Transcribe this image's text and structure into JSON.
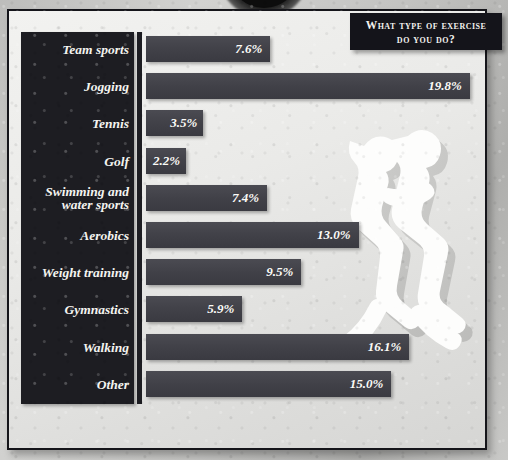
{
  "title": {
    "line1": "What type of exercise",
    "line2": "do you do?",
    "full": "What type of exercise do you do?"
  },
  "colors": {
    "panel_dark": "#1d1d22",
    "bar_fill": "#414148",
    "value_text": "#fbfbf7",
    "label_text": "#f4f4f0",
    "page_background": "#c4c4c2",
    "chart_background": "#eaeae8"
  },
  "decor": {
    "runners_watermark": "two-runners-silhouette",
    "top_arc": "dark-arc-shape"
  },
  "chart_data": {
    "type": "bar",
    "orientation": "horizontal",
    "title": "What type of exercise do you do?",
    "xlabel": "",
    "ylabel": "",
    "xlim": [
      0,
      20
    ],
    "grid": false,
    "legend": "none",
    "unit": "%",
    "categories": [
      "Team sports",
      "Jogging",
      "Tennis",
      "Golf",
      "Swimming and water sports",
      "Aerobics",
      "Weight training",
      "Gymnastics",
      "Walking",
      "Other"
    ],
    "values": [
      7.6,
      19.8,
      3.5,
      2.2,
      7.4,
      13.0,
      9.5,
      5.9,
      16.1,
      15.0
    ],
    "labels": [
      "7.6%",
      "19.8%",
      "3.5%",
      "2.2%",
      "7.4%",
      "13.0%",
      "9.5%",
      "5.9%",
      "16.1%",
      "15.0%"
    ]
  },
  "rows": [
    {
      "label": "Team sports",
      "label2": "",
      "value": "7.6%",
      "pct": 7.6
    },
    {
      "label": "Jogging",
      "label2": "",
      "value": "19.8%",
      "pct": 19.8
    },
    {
      "label": "Tennis",
      "label2": "",
      "value": "3.5%",
      "pct": 3.5
    },
    {
      "label": "Golf",
      "label2": "",
      "value": "2.2%",
      "pct": 2.2
    },
    {
      "label": "Swimming and",
      "label2": "water sports",
      "value": "7.4%",
      "pct": 7.4
    },
    {
      "label": "Aerobics",
      "label2": "",
      "value": "13.0%",
      "pct": 13.0
    },
    {
      "label": "Weight training",
      "label2": "",
      "value": "9.5%",
      "pct": 9.5
    },
    {
      "label": "Gymnastics",
      "label2": "",
      "value": "5.9%",
      "pct": 5.9
    },
    {
      "label": "Walking",
      "label2": "",
      "value": "16.1%",
      "pct": 16.1
    },
    {
      "label": "Other",
      "label2": "",
      "value": "15.0%",
      "pct": 15.0
    }
  ]
}
